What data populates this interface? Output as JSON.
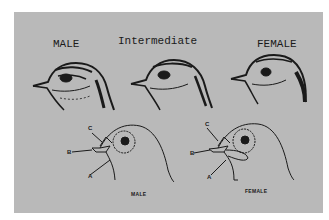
{
  "figure": {
    "top_labels": {
      "male": "MALE",
      "intermediate": "Intermediate",
      "female": "FEMALE"
    },
    "diagram_labels": {
      "male": "MALE",
      "female": "FEMALE"
    },
    "pointer_letters": {
      "a": "A",
      "b": "B",
      "c": "C"
    },
    "colors": {
      "background": "#ffffff",
      "panel": "#b9b9b9",
      "ink": "#1a1a1a"
    }
  }
}
